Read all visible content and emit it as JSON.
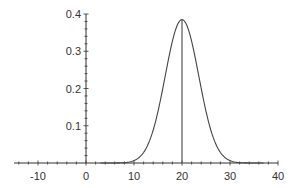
{
  "chart_data": {
    "type": "line",
    "title": "",
    "xlabel": "",
    "ylabel": "",
    "xlim": [
      -15,
      40
    ],
    "ylim": [
      0,
      0.4
    ],
    "grid": false,
    "legend": null,
    "x_ticks": [
      "-10",
      "0",
      "10",
      "20",
      "30",
      "40"
    ],
    "y_ticks": [
      "0.1",
      "0.2",
      "0.3",
      "0.4"
    ],
    "series": [
      {
        "name": "density curve",
        "description": "bell-shaped curve centered at x = 20",
        "center": 20,
        "peak": 0.385,
        "spread": 3.5,
        "x": [
          2,
          4,
          6,
          8,
          10,
          12,
          14,
          16,
          18,
          20,
          22,
          24,
          26,
          28,
          30,
          32,
          34,
          36,
          38
        ],
        "y": [
          0.0,
          0.001,
          0.001,
          0.012,
          0.007,
          0.028,
          0.088,
          0.201,
          0.328,
          0.385,
          0.328,
          0.201,
          0.088,
          0.028,
          0.007,
          0.012,
          0.001,
          0.001,
          0.0
        ]
      }
    ],
    "annotations": [
      {
        "type": "vertical-line",
        "x": 20,
        "from_y": 0,
        "to_y": 0.385,
        "description": "line at the mean from axis to peak"
      }
    ]
  },
  "colors": {
    "axis": "#333333",
    "curve": "#444444",
    "background": "#ffffff"
  }
}
